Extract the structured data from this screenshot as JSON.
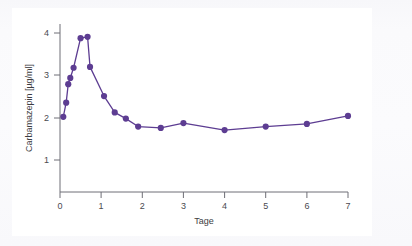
{
  "figure": {
    "background_color": "#fbfbfd",
    "plot_background_color": "#ffffff"
  },
  "chart_data": {
    "type": "line",
    "title": "",
    "subtitle": "",
    "xlabel": "Tage",
    "ylabel": "Carbamazepin [µg/ml]",
    "xlim": [
      0,
      7
    ],
    "ylim": [
      0.55,
      4.35
    ],
    "xticks": [
      0,
      1,
      2,
      3,
      4,
      5,
      6,
      7
    ],
    "xtick_labels": [
      "0",
      "1",
      "2",
      "3",
      "4",
      "5",
      "6",
      "7"
    ],
    "yticks": [
      1,
      2,
      3,
      4
    ],
    "ytick_labels": [
      "1",
      "2",
      "3",
      "4"
    ],
    "grid": false,
    "legend": false,
    "legend_position": "none",
    "marker": "circle",
    "marker_size": 5,
    "line_width": 1.3,
    "series": [
      {
        "name": "Carbamazepin Serumkonzentration",
        "color": "#5d3d92",
        "x": [
          0.08,
          0.15,
          0.2,
          0.25,
          0.33,
          0.5,
          0.67,
          0.73,
          1.07,
          1.33,
          1.6,
          1.9,
          2.45,
          3.0,
          4.0,
          5.0,
          6.0,
          7.0
        ],
        "values": [
          2.25,
          2.57,
          2.99,
          3.13,
          3.36,
          4.03,
          4.06,
          3.38,
          2.72,
          2.35,
          2.21,
          2.03,
          2.0,
          2.11,
          1.95,
          2.03,
          2.09,
          2.27
        ]
      }
    ],
    "annotations": []
  },
  "colors": {
    "series_purple": "#5d3d92",
    "axis_gray": "#6e6e76",
    "tick_text": "#4a4a50"
  }
}
